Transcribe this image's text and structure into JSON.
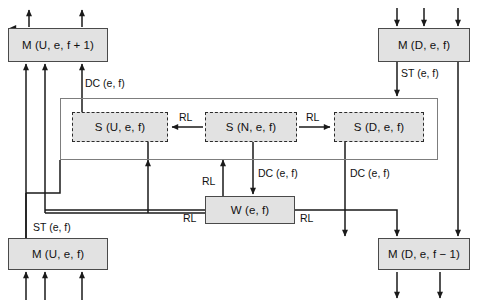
{
  "diagram": {
    "colors": {
      "box_fill": "#e2e2e2",
      "box_stroke": "#4a4a4a",
      "dashed_stroke": "#2b2b2b",
      "frame_stroke": "#7d7d7d",
      "line": "#1a1a1a",
      "background": "#ffffff"
    },
    "nodes": [
      {
        "id": "m_u_f1",
        "label": "M (U, e, f + 1)",
        "style": "solid",
        "x": 8,
        "y": 28,
        "w": 100,
        "h": 34
      },
      {
        "id": "m_d_f",
        "label": "M (D, e, f)",
        "style": "solid",
        "x": 378,
        "y": 28,
        "w": 92,
        "h": 34
      },
      {
        "id": "s_u",
        "label": "S (U, e, f)",
        "style": "dashed",
        "x": 72,
        "y": 112,
        "w": 96,
        "h": 30
      },
      {
        "id": "s_n",
        "label": "S (N, e, f)",
        "style": "dashed",
        "x": 205,
        "y": 112,
        "w": 92,
        "h": 30
      },
      {
        "id": "s_d",
        "label": "S (D, e, f)",
        "style": "dashed",
        "x": 334,
        "y": 112,
        "w": 90,
        "h": 30
      },
      {
        "id": "w_ef",
        "label": "W (e, f)",
        "style": "solid",
        "x": 205,
        "y": 196,
        "w": 90,
        "h": 28
      },
      {
        "id": "m_u_f",
        "label": "M (U, e, f)",
        "style": "solid",
        "x": 8,
        "y": 238,
        "w": 100,
        "h": 32
      },
      {
        "id": "m_d_fm1",
        "label": "M (D, e, f − 1)",
        "style": "solid",
        "x": 378,
        "y": 238,
        "w": 92,
        "h": 32
      }
    ],
    "group_frame": {
      "id": "state-group-frame",
      "x": 60,
      "y": 98,
      "w": 378,
      "h": 62
    },
    "edge_labels": [
      {
        "id": "dc_top",
        "text": "DC (e, f)",
        "x": 85,
        "y": 78
      },
      {
        "id": "st_right",
        "text": "ST (e, f)",
        "x": 396,
        "y": 70
      },
      {
        "id": "rl_left",
        "text": "RL",
        "x": 181,
        "y": 113
      },
      {
        "id": "rl_right",
        "text": "RL",
        "x": 308,
        "y": 113
      },
      {
        "id": "rl_up",
        "text": "RL",
        "x": 196,
        "y": 180
      },
      {
        "id": "dc_mid",
        "text": "DC (e, f)",
        "x": 276,
        "y": 169
      },
      {
        "id": "dc_right",
        "text": "DC (e, f)",
        "x": 355,
        "y": 169
      },
      {
        "id": "rl_w_left",
        "text": "RL",
        "x": 182,
        "y": 212
      },
      {
        "id": "rl_w_right",
        "text": "RL",
        "x": 299,
        "y": 212
      },
      {
        "id": "st_left",
        "text": "ST (e, f)",
        "x": 35,
        "y": 224
      }
    ]
  }
}
